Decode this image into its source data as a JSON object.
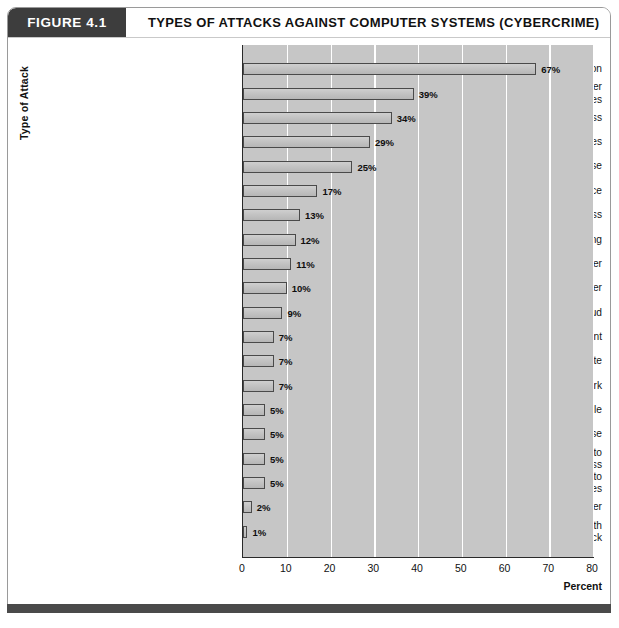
{
  "header": {
    "figure_number": "FIGURE 4.1",
    "title": "TYPES OF ATTACKS AGAINST COMPUTER SYSTEMS (CYBERCRIME)"
  },
  "chart_data": {
    "type": "bar",
    "orientation": "horizontal",
    "title": "TYPES OF ATTACKS AGAINST COMPUTER SYSTEMS (CYBERCRIME)",
    "xlabel": "Percent",
    "ylabel": "Type of Attack",
    "xlim": [
      0,
      80
    ],
    "xticks": [
      0,
      10,
      20,
      30,
      40,
      50,
      60,
      70,
      80
    ],
    "xtick_labels": [
      "0",
      "10",
      "20",
      "30",
      "40",
      "50",
      "60",
      "70",
      "80"
    ],
    "grid": "vertical",
    "legend": "none",
    "value_suffix": "%",
    "categories": [
      "Malware infection",
      "Being fraudulently represented as sender of phishing messges",
      "Laptop or mobile hardware theft or loss",
      "Bots/zombies",
      "Insider abuse",
      "Denial of service",
      "Unauthorized access",
      "Password sniffing",
      "System penetration by outsider",
      "Exploit of client Web browser",
      "Financial fraud",
      "Web site defacement",
      "Other exploit of public-facing Web site",
      "Exploit of wireless network",
      "Exploit of user's social network profile",
      "Instant messaging abuse",
      "Theft of or unauthorized access to PII or PHI due to mobile device theft/loss",
      "Theft of or unauthorized access to intellectual property due to all other causes",
      "Exploit of DNS server",
      "Extortion or blackmail associated with threat of attack"
    ],
    "category_lines": [
      [
        "Malware infection"
      ],
      [
        "Being fraudulently represented as sender",
        "of phishing messges"
      ],
      [
        "Laptop or mobile hardware theft or loss"
      ],
      [
        "Bots/zombies"
      ],
      [
        "Insider abuse"
      ],
      [
        "Denial of service"
      ],
      [
        "Unauthorized access"
      ],
      [
        "Password sniffing"
      ],
      [
        "System penetration by outsider"
      ],
      [
        "Exploit of client Web browser"
      ],
      [
        "Financial fraud"
      ],
      [
        "Web site defacement"
      ],
      [
        "Other exploit of public-facing Web site"
      ],
      [
        "Exploit of wireless network"
      ],
      [
        "Exploit of user's social network profile"
      ],
      [
        "Instant messaging abuse"
      ],
      [
        "Theft of or unauthorized access to",
        "PII or PHI due to mobile device theft/loss"
      ],
      [
        "Theft of or unauthorized access to",
        "intellectual property due to all other causes"
      ],
      [
        "Exploit of DNS server"
      ],
      [
        "Extortion or blackmail associated with",
        "threat of attack"
      ]
    ],
    "values": [
      67,
      39,
      34,
      29,
      25,
      17,
      13,
      12,
      11,
      10,
      9,
      7,
      7,
      7,
      5,
      5,
      5,
      5,
      2,
      1
    ],
    "value_labels": [
      "67%",
      "39%",
      "34%",
      "29%",
      "25%",
      "17%",
      "13%",
      "12%",
      "11%",
      "10%",
      "9%",
      "7%",
      "7%",
      "7%",
      "5%",
      "5%",
      "5%",
      "5%",
      "2%",
      "1%"
    ]
  },
  "colors": {
    "plot_background": "#c6c6c6",
    "bar_fill": "#c6c6c6",
    "bar_border": "#4a4a4a",
    "gridline": "#ffffff",
    "axis": "#2a2a2a",
    "header_badge": "#3d3d3d",
    "footer_bar": "#4a4a4a"
  }
}
